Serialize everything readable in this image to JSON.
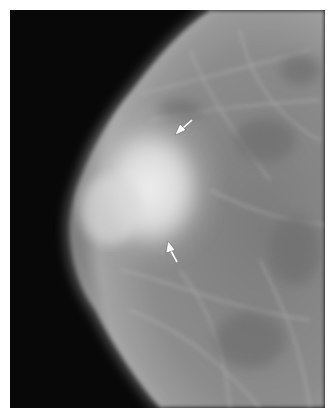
{
  "figure": {
    "type": "mammogram",
    "background_color": "#ffffff",
    "image_background": "#080808",
    "tissue_color": "#8a8a8a",
    "mass_color": "#e6e6e6",
    "arrows": [
      {
        "id": "upper-arrow",
        "direction": "down-left",
        "color": "#ffffff"
      },
      {
        "id": "lower-arrow",
        "direction": "up-left",
        "color": "#ffffff"
      }
    ]
  }
}
